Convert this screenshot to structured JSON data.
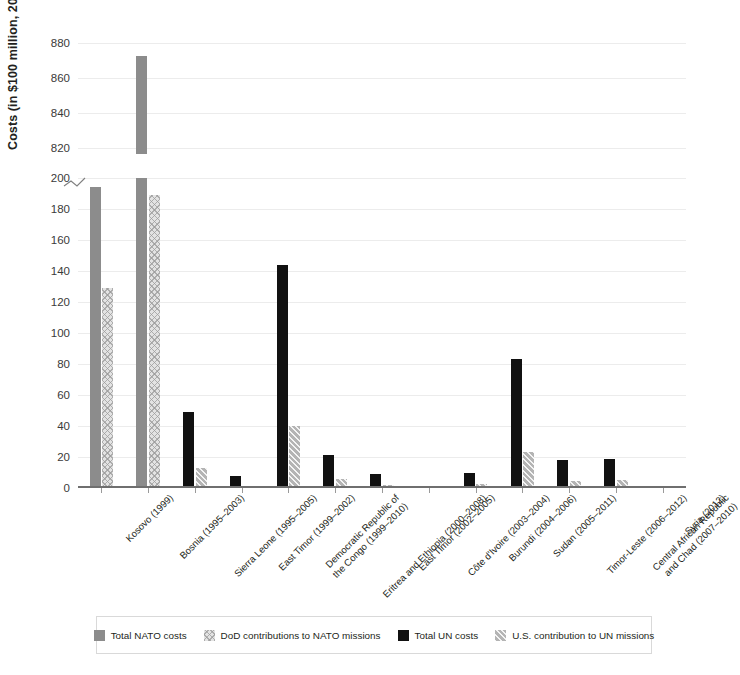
{
  "chart_data": {
    "type": "bar",
    "title": "",
    "xlabel": "",
    "ylabel": "Costs (in $100 million, 2022 dollars)",
    "grid": true,
    "legend_position": "bottom",
    "axis_break": {
      "present": true,
      "lower_max": 200,
      "upper_min": 820
    },
    "ylim_lower": [
      0,
      200
    ],
    "ylim_upper": [
      820,
      880
    ],
    "yticks_lower": [
      "0",
      "20",
      "40",
      "60",
      "80",
      "100",
      "120",
      "140",
      "160",
      "180",
      "200"
    ],
    "yticks_upper": [
      "820",
      "840",
      "860",
      "880"
    ],
    "categories": [
      "Kosovo (1999)",
      "Bosnia (1995–2003)",
      "Sierra Leone (1995–2005)",
      "East Timor (1999–2002)",
      "Democratic Republic of\nthe Congo (1999–2010)",
      "Eritrea and Ethiopia (2000–2008)",
      "East Timor (2002–2005)",
      "Côte d'Ivoire (2003–2004)",
      "Burundi (2004–2006)",
      "Sudan (2005–2011)",
      "Timor-Leste (2006–2012)",
      "Central African Republic\nand Chad (2007–2010)",
      "Syria (2012)"
    ],
    "series": [
      {
        "name": "Total NATO costs",
        "key": "nato",
        "color": "#8c8c8c",
        "pattern": "solid",
        "values": [
          194,
          876,
          null,
          null,
          null,
          null,
          null,
          null,
          null,
          null,
          null,
          null,
          null
        ]
      },
      {
        "name": "DoD contributions to NATO missions",
        "key": "dod",
        "color": "#e3e3e3",
        "pattern": "crosshatch",
        "values": [
          129,
          189,
          null,
          null,
          null,
          null,
          null,
          null,
          null,
          null,
          null,
          null,
          null
        ]
      },
      {
        "name": "Total UN costs",
        "key": "un",
        "color": "#111111",
        "pattern": "solid",
        "values": [
          null,
          null,
          49,
          8,
          144,
          21,
          9,
          0.5,
          10,
          83,
          18,
          19,
          0.3
        ]
      },
      {
        "name": "U.S. contribution to UN missions",
        "key": "us",
        "color": "#b4b4b4",
        "pattern": "diagonal",
        "values": [
          null,
          null,
          13,
          1.5,
          40,
          6,
          2,
          0.3,
          2.5,
          23,
          4.5,
          5,
          0.2
        ]
      }
    ]
  },
  "legend": [
    {
      "label": "Total NATO costs",
      "swatch": "nato-swatch"
    },
    {
      "label": "DoD contributions to NATO missions",
      "swatch": "dod-swatch"
    },
    {
      "label": "Total UN costs",
      "swatch": "un-swatch"
    },
    {
      "label": "U.S. contribution to UN missions",
      "swatch": "us-swatch"
    }
  ]
}
